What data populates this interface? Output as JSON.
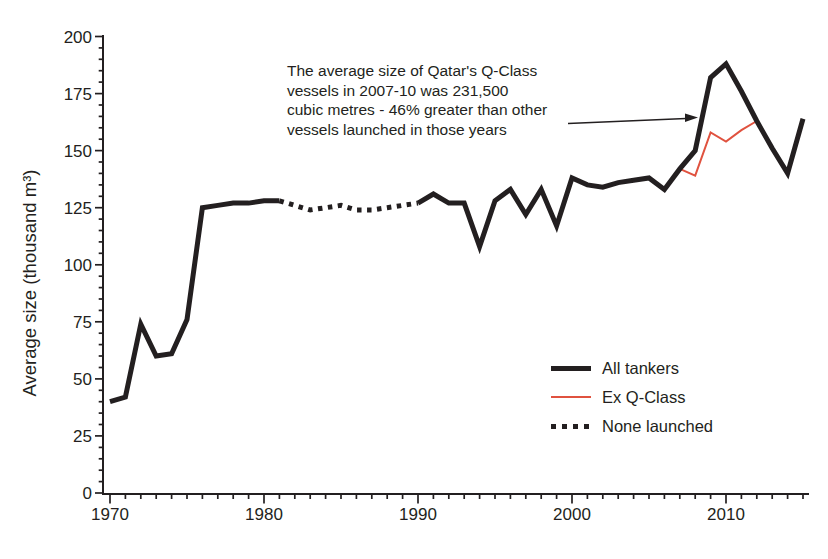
{
  "figure": {
    "background": "#ffffff",
    "ink_color": "#231f20"
  },
  "chart_data": {
    "type": "line",
    "title": "",
    "xlabel": "",
    "ylabel": "Average size (thousand m³)",
    "grid": false,
    "legend_position": "lower-right",
    "x_axis": {
      "min": 1970,
      "max": 2015,
      "major_ticks": [
        1970,
        1980,
        1990,
        2000,
        2010
      ],
      "minor_step": 1
    },
    "y_axis": {
      "min": 0,
      "max": 200,
      "major_ticks": [
        0,
        25,
        50,
        75,
        100,
        125,
        150,
        175,
        200
      ],
      "minor_step": 5
    },
    "series": [
      {
        "name": "All tankers",
        "style": "solid",
        "color": "#231f20",
        "width": 5,
        "segments": [
          [
            [
              1970,
              40
            ],
            [
              1971,
              42
            ],
            [
              1972,
              74
            ],
            [
              1973,
              60
            ],
            [
              1974,
              61
            ],
            [
              1975,
              76
            ],
            [
              1976,
              125
            ],
            [
              1977,
              126
            ],
            [
              1978,
              127
            ],
            [
              1979,
              127
            ],
            [
              1980,
              128
            ],
            [
              1981,
              128
            ]
          ],
          [
            [
              1990,
              127
            ],
            [
              1991,
              131
            ],
            [
              1992,
              127
            ],
            [
              1993,
              127
            ],
            [
              1994,
              108
            ],
            [
              1995,
              128
            ],
            [
              1996,
              133
            ],
            [
              1997,
              122
            ],
            [
              1998,
              133
            ],
            [
              1999,
              117
            ],
            [
              2000,
              138
            ],
            [
              2001,
              135
            ],
            [
              2002,
              134
            ],
            [
              2003,
              136
            ],
            [
              2004,
              137
            ],
            [
              2005,
              138
            ],
            [
              2006,
              133
            ],
            [
              2007,
              142
            ],
            [
              2008,
              150
            ],
            [
              2009,
              182
            ],
            [
              2010,
              188
            ],
            [
              2011,
              176
            ],
            [
              2012,
              163
            ],
            [
              2013,
              151
            ],
            [
              2014,
              140
            ],
            [
              2015,
              164
            ]
          ]
        ]
      },
      {
        "name": "Ex Q-Class",
        "style": "solid",
        "color": "#e0523f",
        "width": 2,
        "segments": [
          [
            [
              2007,
              142
            ],
            [
              2008,
              139
            ],
            [
              2009,
              158
            ],
            [
              2010,
              154
            ],
            [
              2011,
              159
            ],
            [
              2012,
              163
            ]
          ]
        ]
      },
      {
        "name": "None launched",
        "style": "dotted",
        "color": "#231f20",
        "width": 5,
        "segments": [
          [
            [
              1981,
              128
            ],
            [
              1982,
              126
            ],
            [
              1983,
              124
            ],
            [
              1984,
              125
            ],
            [
              1985,
              126
            ],
            [
              1986,
              124
            ],
            [
              1987,
              124
            ],
            [
              1988,
              125
            ],
            [
              1989,
              126
            ],
            [
              1990,
              127
            ]
          ]
        ]
      }
    ]
  },
  "annotation": {
    "lines": [
      "The average size of Qatar's Q-Class",
      "vessels in 2007-10 was 231,500",
      "cubic metres - 46% greater than other",
      "vessels launched in those years"
    ]
  },
  "legend": {
    "items": [
      {
        "label": "All tankers",
        "swatch": "solid-thick-black"
      },
      {
        "label": "Ex Q-Class",
        "swatch": "thin-red"
      },
      {
        "label": "None launched",
        "swatch": "dotted-black"
      }
    ]
  }
}
